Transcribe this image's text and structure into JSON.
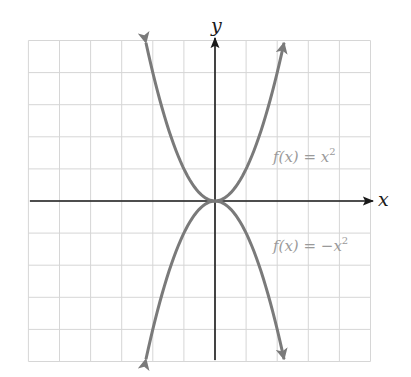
{
  "chart_data": {
    "type": "line",
    "title": "",
    "xlabel": "x",
    "ylabel": "y",
    "xlim": [
      -6,
      5
    ],
    "ylim": [
      -5,
      5
    ],
    "grid": true,
    "grid_step": 1,
    "series": [
      {
        "name": "f(x) = x^2",
        "label": "f(x) = x²",
        "x": [
          -2.25,
          -2,
          -1.5,
          -1,
          -0.5,
          0,
          0.5,
          1,
          1.5,
          2,
          2.25
        ],
        "y": [
          5.06,
          4,
          2.25,
          1,
          0.25,
          0,
          0.25,
          1,
          2.25,
          4,
          5.06
        ],
        "arrows_at_ends": true
      },
      {
        "name": "f(x) = -x^2",
        "label": "f(x) = −x²",
        "x": [
          -2.25,
          -2,
          -1.5,
          -1,
          -0.5,
          0,
          0.5,
          1,
          1.5,
          2,
          2.25
        ],
        "y": [
          -5.06,
          -4,
          -2.25,
          -1,
          -0.25,
          0,
          -0.25,
          -1,
          -2.25,
          -4,
          -5.06
        ],
        "arrows_at_ends": true
      }
    ],
    "legend": "inline labels right of curves"
  },
  "axes": {
    "x_label": "x",
    "y_label": "y"
  },
  "labels": {
    "upper_f": "f",
    "upper_x": "(x) = x",
    "upper_exp": "2",
    "lower_f": "f",
    "lower_x": "(x) = −x",
    "lower_exp": "2"
  },
  "colors": {
    "curve": "#7a7a7a",
    "axis": "#1a1a1a",
    "grid": "#d6d6d6",
    "label": "#9a9a9a"
  }
}
